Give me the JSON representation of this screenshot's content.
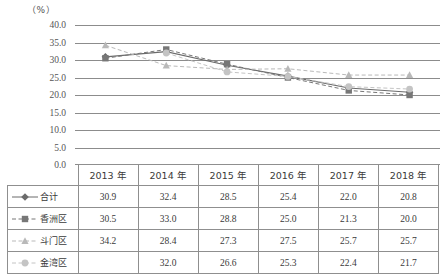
{
  "chart_data": {
    "type": "line",
    "title": "",
    "xlabel": "",
    "ylabel": "",
    "unit_label": "（%）",
    "ylim": [
      0.0,
      40.0
    ],
    "ytick_step": 5.0,
    "yticks": [
      "40.0",
      "35.0",
      "30.0",
      "25.0",
      "20.0",
      "15.0",
      "10.0",
      "5.0",
      "0.0"
    ],
    "grid": true,
    "legend_position": "row-labels-in-table",
    "categories": [
      "2013 年",
      "2014 年",
      "2015 年",
      "2016 年",
      "2017 年",
      "2018 年"
    ],
    "series": [
      {
        "name": "合计",
        "marker": "diamond",
        "line_style": "solid",
        "color": "#6b6b6b",
        "values": [
          30.9,
          32.4,
          28.5,
          25.4,
          22.0,
          20.8
        ],
        "labels": [
          "30.9",
          "32.4",
          "28.5",
          "25.4",
          "22.0",
          "20.8"
        ]
      },
      {
        "name": "香洲区",
        "marker": "square",
        "line_style": "dashed",
        "color": "#777777",
        "values": [
          30.5,
          33.0,
          28.8,
          25.0,
          21.3,
          20.0
        ],
        "labels": [
          "30.5",
          "33.0",
          "28.8",
          "25.0",
          "21.3",
          "20.0"
        ]
      },
      {
        "name": "斗门区",
        "marker": "triangle",
        "line_style": "dashed",
        "color": "#b9b9b9",
        "values": [
          34.2,
          28.4,
          27.3,
          27.5,
          25.7,
          25.7
        ],
        "labels": [
          "34.2",
          "28.4",
          "27.3",
          "27.5",
          "25.7",
          "25.7"
        ]
      },
      {
        "name": "金湾区",
        "marker": "circle",
        "line_style": "dashed",
        "color": "#c4c4c4",
        "values": [
          null,
          32.0,
          26.6,
          25.3,
          22.4,
          21.7
        ],
        "labels": [
          "",
          "32.0",
          "26.6",
          "25.3",
          "22.4",
          "21.7"
        ]
      }
    ]
  },
  "table": {
    "corner_label": "",
    "headers": [
      "2013 年",
      "2014 年",
      "2015 年",
      "2016 年",
      "2017 年",
      "2018 年"
    ],
    "rows": [
      {
        "label": "合计",
        "values": [
          "30.9",
          "32.4",
          "28.5",
          "25.4",
          "22.0",
          "20.8"
        ]
      },
      {
        "label": "香洲区",
        "values": [
          "30.5",
          "33.0",
          "28.8",
          "25.0",
          "21.3",
          "20.0"
        ]
      },
      {
        "label": "斗门区",
        "values": [
          "34.2",
          "28.4",
          "27.3",
          "27.5",
          "25.7",
          "25.7"
        ]
      },
      {
        "label": "金湾区",
        "values": [
          "",
          "32.0",
          "26.6",
          "25.3",
          "22.4",
          "21.7"
        ]
      }
    ]
  },
  "axis": {
    "ytick_0": "40.0",
    "ytick_1": "35.0",
    "ytick_2": "30.0",
    "ytick_3": "25.0",
    "ytick_4": "20.0",
    "ytick_5": "15.0",
    "ytick_6": "10.0",
    "ytick_7": "5.0",
    "ytick_8": "0.0"
  }
}
